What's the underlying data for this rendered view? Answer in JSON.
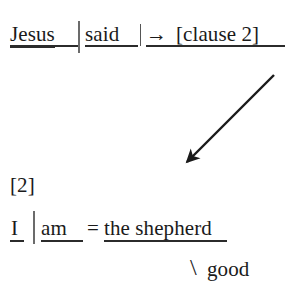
{
  "diagram": {
    "type": "clause-analysis",
    "background_color": "#ffffff",
    "ink_color": "#1a1a1a",
    "rule_color": "#2b2b2b",
    "bar_color": "#6b6b6b"
  },
  "clause_one": {
    "subject": "Jesus",
    "separator_primary": "|",
    "predicate": "said",
    "separator_secondary": "|",
    "arrow_glyph": "→",
    "complement": "[clause 2]"
  },
  "connector": {
    "name": "diagonal-arrow",
    "from": {
      "x": 274,
      "y": 75
    },
    "to": {
      "x": 180,
      "y": 169
    },
    "stroke_width": 2.4,
    "color": "#1a1a1a"
  },
  "clause_two": {
    "label": "[2]",
    "subject": "I",
    "separator_primary": "|",
    "predicate": "am",
    "equals": "=",
    "complement": "the shepherd",
    "modifier_slash": "\\",
    "modifier": "good"
  }
}
